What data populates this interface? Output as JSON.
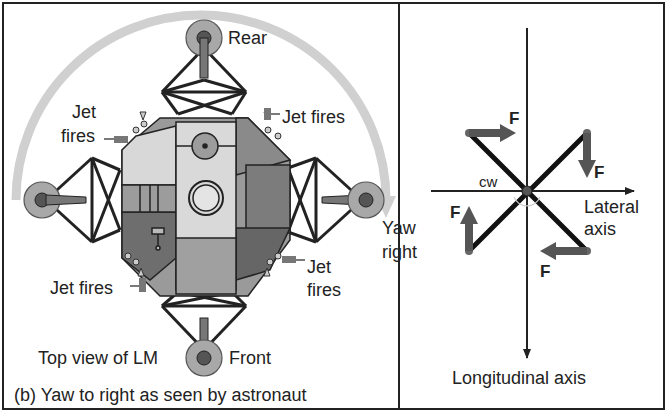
{
  "diagram": {
    "caption": "(b) Yaw to right as seen by astronaut",
    "left_panel": {
      "labels": {
        "rear": "Rear",
        "front": "Front",
        "top_view": "Top view of LM",
        "jet_top_left_line1": "Jet",
        "jet_top_left_line2": "fires",
        "jet_top_right": "Jet fires",
        "jet_bottom_left": "Jet fires",
        "jet_bottom_right_line1": "Jet",
        "jet_bottom_right_line2": "fires",
        "yaw_line1": "Yaw",
        "yaw_line2": "right"
      },
      "rotation_arrow": "clockwise arc arrow over the lunar module"
    },
    "right_panel": {
      "labels": {
        "cw": "cw",
        "lateral_line1": "Lateral",
        "lateral_line2": "axis",
        "longitudinal": "Longitudinal axis",
        "force": "F"
      },
      "forces": [
        {
          "position": "top-left",
          "direction": "right",
          "label": "F"
        },
        {
          "position": "top-right",
          "direction": "down",
          "label": "F"
        },
        {
          "position": "bottom-right",
          "direction": "left",
          "label": "F"
        },
        {
          "position": "bottom-left",
          "direction": "up",
          "label": "F"
        }
      ]
    },
    "colors": {
      "line": "#222222",
      "light_gray": "#d6d6d6",
      "mid_gray": "#9a9a9a",
      "dark_gray": "#6e6e6e",
      "arc": "#cfcfcf",
      "force_arrow": "#555555"
    }
  }
}
